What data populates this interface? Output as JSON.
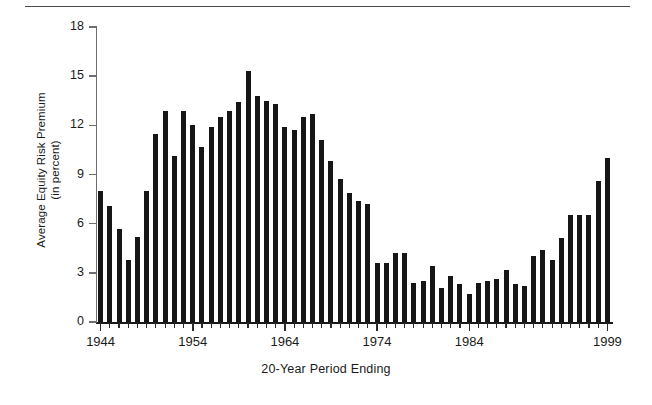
{
  "figure": {
    "width": 652,
    "height": 405,
    "background": "#ffffff",
    "bar_color": "#161616",
    "axis_color": "#1a1a1a",
    "rule_color": "#4a4a4a"
  },
  "chart_data": {
    "type": "bar",
    "title": "",
    "xlabel": "20-Year Period Ending",
    "ylabel": "Average Equity Risk Premium\n(in percent)",
    "ylim": [
      0,
      18
    ],
    "yticks": [
      0,
      3,
      6,
      9,
      12,
      15,
      18
    ],
    "xlim": [
      1944,
      1999
    ],
    "xticks": [
      1944,
      1954,
      1964,
      1974,
      1984,
      1999
    ],
    "xtick_labels": [
      "1944",
      "1954",
      "1964",
      "1974",
      "1984",
      "1999"
    ],
    "grid": false,
    "legend": null,
    "categories": [
      "1944",
      "1945",
      "1946",
      "1947",
      "1948",
      "1949",
      "1950",
      "1951",
      "1952",
      "1953",
      "1954",
      "1955",
      "1956",
      "1957",
      "1958",
      "1959",
      "1960",
      "1961",
      "1962",
      "1963",
      "1964",
      "1965",
      "1966",
      "1967",
      "1968",
      "1969",
      "1970",
      "1971",
      "1972",
      "1973",
      "1974",
      "1975",
      "1976",
      "1977",
      "1978",
      "1979",
      "1980",
      "1981",
      "1982",
      "1983",
      "1984",
      "1985",
      "1986",
      "1987",
      "1988",
      "1989",
      "1990",
      "1991",
      "1992",
      "1993",
      "1994",
      "1995",
      "1996",
      "1997",
      "1998",
      "1999"
    ],
    "values": [
      8.0,
      7.1,
      5.7,
      3.8,
      5.2,
      8.0,
      11.5,
      12.9,
      10.1,
      12.9,
      12.0,
      10.7,
      11.9,
      12.5,
      12.9,
      13.4,
      15.3,
      13.8,
      13.5,
      13.3,
      11.9,
      11.7,
      12.5,
      12.7,
      11.1,
      9.8,
      8.7,
      7.9,
      7.4,
      7.2,
      3.6,
      3.6,
      4.2,
      4.2,
      2.4,
      2.5,
      3.4,
      2.1,
      2.8,
      2.3,
      1.7,
      2.4,
      2.5,
      2.6,
      3.2,
      2.3,
      2.2,
      4.0,
      4.4,
      3.8,
      5.1,
      6.5,
      6.5,
      6.5,
      8.6,
      10.0
    ],
    "unit": "percent"
  }
}
